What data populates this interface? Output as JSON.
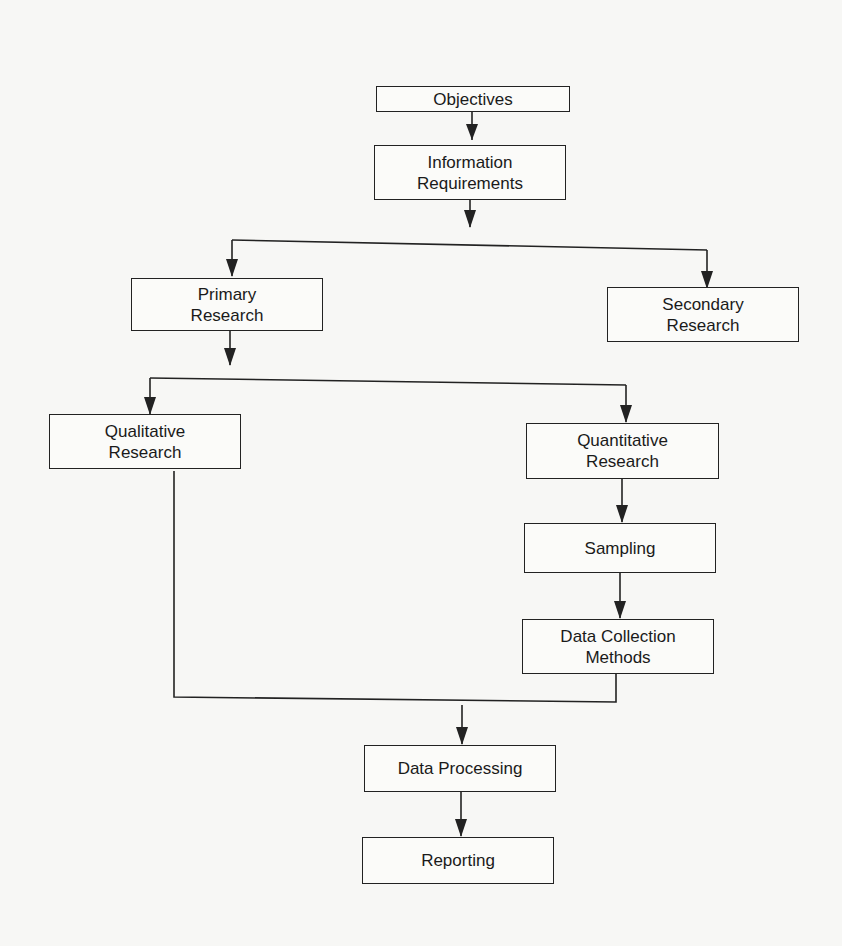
{
  "diagram": {
    "type": "flowchart",
    "title": "",
    "nodes": [
      {
        "id": "objectives",
        "label": "Objectives"
      },
      {
        "id": "information_requirements",
        "label": "Information\nRequirements"
      },
      {
        "id": "primary_research",
        "label": "Primary\nResearch"
      },
      {
        "id": "secondary_research",
        "label": "Secondary\nResearch"
      },
      {
        "id": "qualitative_research",
        "label": "Qualitative\nResearch"
      },
      {
        "id": "quantitative_research",
        "label": "Quantitative\nResearch"
      },
      {
        "id": "sampling",
        "label": "Sampling"
      },
      {
        "id": "data_collection_methods",
        "label": "Data Collection\nMethods"
      },
      {
        "id": "data_processing",
        "label": "Data Processing"
      },
      {
        "id": "reporting",
        "label": "Reporting"
      }
    ],
    "edges": [
      {
        "from": "objectives",
        "to": "information_requirements"
      },
      {
        "from": "information_requirements",
        "to": "primary_research"
      },
      {
        "from": "information_requirements",
        "to": "secondary_research"
      },
      {
        "from": "primary_research",
        "to": "qualitative_research"
      },
      {
        "from": "primary_research",
        "to": "quantitative_research"
      },
      {
        "from": "quantitative_research",
        "to": "sampling"
      },
      {
        "from": "sampling",
        "to": "data_collection_methods"
      },
      {
        "from": "qualitative_research",
        "to": "data_processing"
      },
      {
        "from": "data_collection_methods",
        "to": "data_processing"
      },
      {
        "from": "data_processing",
        "to": "reporting"
      }
    ],
    "colors": {
      "line": "#222222",
      "box_fill": "#fbfbf9",
      "background": "#f7f7f5"
    }
  }
}
